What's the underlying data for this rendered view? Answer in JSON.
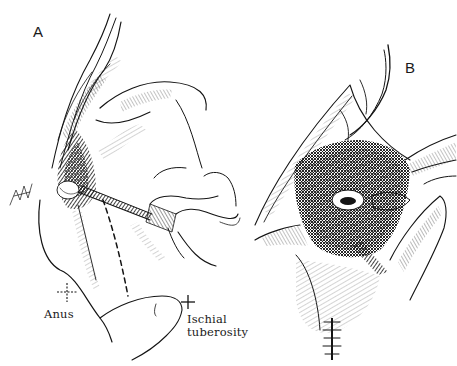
{
  "figure": {
    "panels": [
      {
        "id": "A",
        "label": "A",
        "annotations": {
          "anus": "Anus",
          "ischial_line1": "Ischial",
          "ischial_line2": "tuberosity"
        }
      },
      {
        "id": "B",
        "label": "B"
      }
    ],
    "colors": {
      "ink": "#141414",
      "background": "#ffffff"
    }
  }
}
